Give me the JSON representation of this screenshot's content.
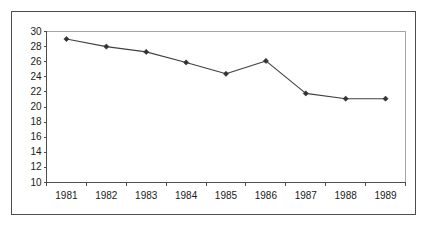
{
  "figure": {
    "background_color": "#ffffff",
    "frame_color": "#4d4d4d",
    "axis_color": "#4d4d4d",
    "plot_border_color": "#a6a6a6",
    "series_color": "#404040",
    "marker_color": "#333333",
    "label_color": "#1a1a1a"
  },
  "chart_data": {
    "type": "line",
    "title": "",
    "subtitle": "",
    "xlabel": "",
    "ylabel": "",
    "categories": [
      "1981",
      "1982",
      "1983",
      "1984",
      "1985",
      "1986",
      "1987",
      "1988",
      "1989"
    ],
    "values": [
      29.0,
      28.0,
      27.3,
      25.9,
      24.4,
      26.1,
      21.8,
      21.1,
      21.1
    ],
    "series": [
      {
        "name": "",
        "values": [
          29.0,
          28.0,
          27.3,
          25.9,
          24.4,
          26.1,
          21.8,
          21.1,
          21.1
        ]
      }
    ],
    "ylim": [
      10,
      30
    ],
    "ytick_step": 2,
    "ytick_labels": [
      "10",
      "12",
      "14",
      "16",
      "18",
      "20",
      "22",
      "24",
      "26",
      "28",
      "30"
    ],
    "ytick_values": [
      10,
      12,
      14,
      16,
      18,
      20,
      22,
      24,
      26,
      28,
      30
    ],
    "xtick_labels": [
      "1981",
      "1982",
      "1983",
      "1984",
      "1985",
      "1986",
      "1987",
      "1988",
      "1989"
    ],
    "grid": false,
    "legend": false,
    "legend_position": "none",
    "marker": "diamond",
    "annotations": []
  }
}
